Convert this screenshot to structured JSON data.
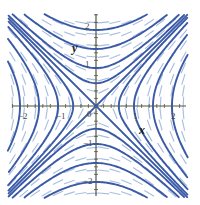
{
  "figure": {
    "kind": "direction-field-plot",
    "background": "#ffffff"
  },
  "colors": {
    "solution_curve": "#3b5aa6",
    "field_dash": "#a9bfe0",
    "axis": "#55553f",
    "tick_text": "#4a4a3d",
    "axis_label": "#1a1a1a"
  },
  "axes": {
    "x_label": "x",
    "y_label": "y",
    "origin_label": "0",
    "x_ticks": [
      {
        "value": -2,
        "label": "−2"
      },
      {
        "value": -1,
        "label": "−1"
      },
      {
        "value": 1,
        "label": "1"
      },
      {
        "value": 2,
        "label": "2"
      }
    ],
    "y_ticks": [
      {
        "value": 2,
        "label": "2"
      },
      {
        "value": 1,
        "label": "1"
      },
      {
        "value": -1,
        "label": "−1"
      },
      {
        "value": -2,
        "label": "−2"
      }
    ],
    "xlim": [
      -2.3,
      2.4
    ],
    "ylim": [
      -2.4,
      2.4
    ],
    "minor_ticks_per_unit": 5,
    "grid": false
  },
  "chart_data": {
    "type": "line",
    "title": "",
    "xlabel": "x",
    "ylabel": "y",
    "xlim": [
      -2.3,
      2.4
    ],
    "ylim": [
      -2.4,
      2.4
    ],
    "grid": false,
    "legend": "none",
    "slope_field": {
      "formula": "dy/dx = x/y",
      "dash_color": "#a9bfe0",
      "x_samples": [
        -2.2,
        -1.9,
        -1.6,
        -1.3,
        -1.0,
        -0.7,
        -0.4,
        -0.1,
        0.2,
        0.5,
        0.8,
        1.1,
        1.4,
        1.7,
        2.0,
        2.3
      ],
      "y_samples": [
        -2.3,
        -2.0,
        -1.7,
        -1.4,
        -1.1,
        -0.8,
        -0.5,
        -0.2,
        0.1,
        0.4,
        0.7,
        1.0,
        1.3,
        1.6,
        1.9,
        2.2
      ]
    },
    "series": [
      {
        "name": "asymptote y = x",
        "c": 0,
        "branch": "diagonal-pos",
        "color": "#3b5aa6"
      },
      {
        "name": "asymptote y = -x",
        "c": 0,
        "branch": "diagonal-neg",
        "color": "#3b5aa6"
      },
      {
        "name": "x^2 - y^2 = -0.36",
        "c": -0.36,
        "color": "#3b5aa6"
      },
      {
        "name": "x^2 - y^2 = -1.00",
        "c": -1.0,
        "color": "#3b5aa6"
      },
      {
        "name": "x^2 - y^2 = -2.25",
        "c": -2.25,
        "color": "#3b5aa6"
      },
      {
        "name": "x^2 - y^2 = -4.00",
        "c": -4.0,
        "color": "#3b5aa6"
      },
      {
        "name": "x^2 - y^2 = 0.36",
        "c": 0.36,
        "color": "#3b5aa6"
      },
      {
        "name": "x^2 - y^2 = 1.00",
        "c": 1.0,
        "color": "#3b5aa6"
      },
      {
        "name": "x^2 - y^2 = 2.25",
        "c": 2.25,
        "color": "#3b5aa6"
      },
      {
        "name": "x^2 - y^2 = 4.00",
        "c": 4.0,
        "color": "#3b5aa6"
      }
    ]
  },
  "geometry": {
    "origin_px": [
      96,
      106
    ],
    "unit_px": 38,
    "x_axis_span_px": [
      12,
      186
    ],
    "y_axis_span_px": [
      14,
      196
    ]
  }
}
